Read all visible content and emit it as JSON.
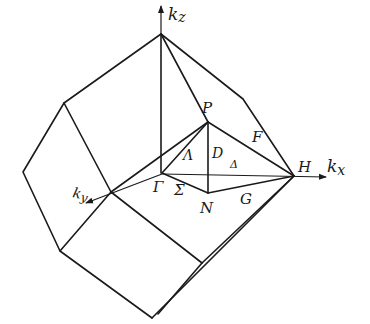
{
  "diagram": {
    "axes": {
      "kz": {
        "label": "k",
        "sub": "z"
      },
      "kx": {
        "label": "k",
        "sub": "x"
      },
      "ky": {
        "label": "k",
        "sub": "y"
      }
    },
    "points": {
      "gamma": "Γ",
      "P": "P",
      "H": "H",
      "N": "N"
    },
    "lines": {
      "lambda": "Λ",
      "D": "D",
      "delta": "Δ",
      "F": "F",
      "G": "G",
      "sigma": "Σ"
    },
    "colors": {
      "stroke": "#1a1a1a",
      "background": "#ffffff"
    }
  }
}
